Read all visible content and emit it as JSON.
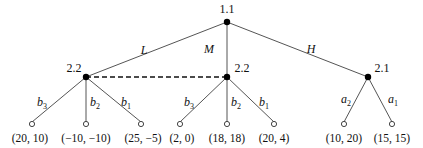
{
  "diagram": {
    "type": "extensive-form game tree",
    "nodes": {
      "root": {
        "label": "1.1"
      },
      "left": {
        "label": "2.2"
      },
      "middle": {
        "label": "2.2"
      },
      "right": {
        "label": "2.1"
      }
    },
    "root_actions": {
      "L": "L",
      "M": "M",
      "H": "H"
    },
    "left_actions": [
      {
        "base": "b",
        "sub": "3"
      },
      {
        "base": "b",
        "sub": "2"
      },
      {
        "base": "b",
        "sub": "1"
      }
    ],
    "middle_actions": [
      {
        "base": "b",
        "sub": "3"
      },
      {
        "base": "b",
        "sub": "2"
      },
      {
        "base": "b",
        "sub": "1"
      }
    ],
    "right_actions": [
      {
        "base": "a",
        "sub": "2"
      },
      {
        "base": "a",
        "sub": "1"
      }
    ],
    "payoffs": {
      "left": [
        "(20, 10)",
        "(−10, −10)",
        "(25, −5)"
      ],
      "middle": [
        "(2, 0)",
        "(18, 18)",
        "(20, 4)"
      ],
      "right": [
        "(10, 20)",
        "(15, 15)"
      ]
    },
    "information_set": "left 2.2 and middle 2.2 connected by dashed line"
  }
}
